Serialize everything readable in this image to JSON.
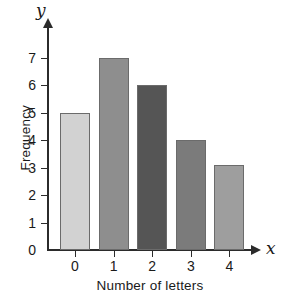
{
  "chart_data": {
    "type": "bar",
    "title": "",
    "xlabel": "Number of letters",
    "ylabel": "Frequency",
    "x_axis_variable": "x",
    "y_axis_variable": "y",
    "categories": [
      "0",
      "1",
      "2",
      "3",
      "4"
    ],
    "values": [
      5,
      7,
      6,
      4,
      3.1
    ],
    "xlim": [
      -0.6,
      4.8
    ],
    "ylim": [
      0,
      7.6
    ],
    "y_ticks": [
      0,
      1,
      2,
      3,
      4,
      5,
      6,
      7
    ],
    "y_tick_labels": [
      "0",
      "1",
      "2",
      "3",
      "4",
      "5",
      "6",
      "7"
    ],
    "x_ticks": [
      0,
      1,
      2,
      3,
      4
    ],
    "x_tick_labels": [
      "0",
      "1",
      "2",
      "3",
      "4"
    ],
    "grid": false,
    "legend": false,
    "bar_colors": [
      "#d2d2d2",
      "#8e8e8e",
      "#555555",
      "#7b7b7b",
      "#9e9e9e"
    ],
    "bar_edge_color": "#6b6b6b",
    "axis_color": "#2b2b2b",
    "background_color": "#ffffff"
  }
}
